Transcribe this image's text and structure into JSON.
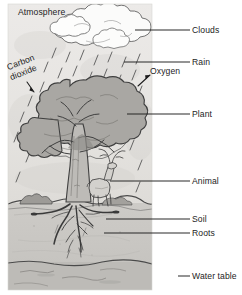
{
  "diagram": {
    "style": "grayscale pencil drawing",
    "panel": {
      "x": 8,
      "y": 4,
      "width": 144,
      "height": 286
    },
    "colors": {
      "sky": "#ebeae8",
      "soil": "#c8c6c2",
      "water_table": "#b9b7b4",
      "canopy": "#a9a7a3",
      "trunk": "#bdbbb7",
      "ink": "#3a3a3a",
      "label_text": "#1d1d1d",
      "leader_line": "#1d1d1d"
    }
  },
  "labels": {
    "atmosphere": {
      "text": "Atmosphere",
      "x": 18,
      "y": 7
    },
    "carbon_dioxide_line1": {
      "text": "Carbon",
      "x": 10,
      "y": 72
    },
    "carbon_dioxide_line2": {
      "text": "dioxide",
      "x": 12,
      "y": 81
    },
    "oxygen": {
      "text": "Oxygen",
      "x": 152,
      "y": 71
    },
    "clouds": {
      "text": "Clouds",
      "x": 192,
      "y": 26
    },
    "rain": {
      "text": "Rain",
      "x": 192,
      "y": 58
    },
    "plant": {
      "text": "Plant",
      "x": 192,
      "y": 110
    },
    "animal": {
      "text": "Animal",
      "x": 192,
      "y": 177
    },
    "soil": {
      "text": "Soil",
      "x": 192,
      "y": 215
    },
    "roots": {
      "text": "Roots",
      "x": 192,
      "y": 229
    },
    "water_table": {
      "text": "Water table",
      "x": 192,
      "y": 272
    }
  },
  "leader_lines": [
    {
      "name": "clouds",
      "x1": 135,
      "y1": 30,
      "x2": 190,
      "y2": 30
    },
    {
      "name": "rain",
      "x1": 124,
      "y1": 62,
      "x2": 190,
      "y2": 62
    },
    {
      "name": "plant",
      "x1": 127,
      "y1": 114,
      "x2": 190,
      "y2": 114
    },
    {
      "name": "animal",
      "x1": 110,
      "y1": 181,
      "x2": 190,
      "y2": 181
    },
    {
      "name": "soil",
      "x1": 106,
      "y1": 219,
      "x2": 190,
      "y2": 219
    },
    {
      "name": "roots",
      "x1": 104,
      "y1": 233,
      "x2": 190,
      "y2": 233
    },
    {
      "name": "water-table",
      "x1": 178,
      "y1": 276,
      "x2": 190,
      "y2": 276
    }
  ],
  "elements": {
    "clouds": "cumulus cloud cluster across the upper sky",
    "rain": "short diagonal rain dashes falling from clouds",
    "tree": "broadleaf tree with wide rounded canopy and forked trunk",
    "animal": "deer standing at the base of the tree",
    "ground_line_y": 203,
    "water_table_line_y": 262,
    "roots": "branching root system spreading below the trunk"
  }
}
